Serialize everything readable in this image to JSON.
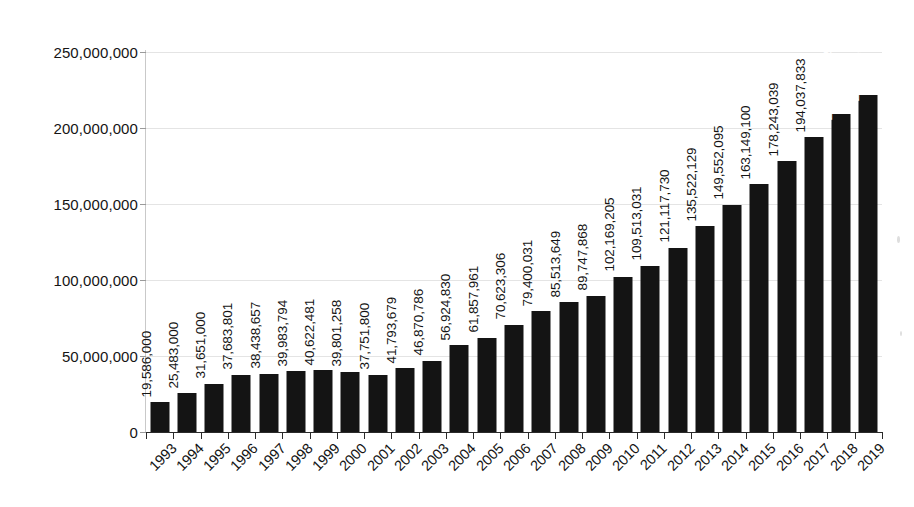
{
  "chart_data": {
    "type": "bar",
    "title": "",
    "subtitle": "",
    "xlabel": "",
    "ylabel": "",
    "grid": true,
    "legend": "none",
    "bar_color": "#141414",
    "gridline_color": "#e4e4e4",
    "axis_color": "#2a2a2a",
    "inside_label_color": "#ffffff",
    "ylim": [
      0,
      250000000
    ],
    "ytick_values": [
      0,
      50000000,
      100000000,
      150000000,
      200000000,
      250000000
    ],
    "ytick_labels": [
      "0",
      "50,000,000",
      "100,000,000",
      "150,000,000",
      "200,000,000",
      "250,000,000"
    ],
    "categories": [
      "1993",
      "1994",
      "1995",
      "1996",
      "1997",
      "1998",
      "1999",
      "2000",
      "2001",
      "2002",
      "2003",
      "2004",
      "2005",
      "2006",
      "2007",
      "2008",
      "2009",
      "2010",
      "2011",
      "2012",
      "2013",
      "2014",
      "2015",
      "2016",
      "2017",
      "2018",
      "2019"
    ],
    "values": [
      19586000,
      25483000,
      31651000,
      37683801,
      38438657,
      39983794,
      40622481,
      39801258,
      37751800,
      41793679,
      46870786,
      56924830,
      61857961,
      70623306,
      79400031,
      85513649,
      89747868,
      102169205,
      109513031,
      121117730,
      135522129,
      149552095,
      163149100,
      178243039,
      194037833,
      208904179,
      221656505
    ],
    "value_labels": [
      "19,586,000",
      "25,483,000",
      "31,651,000",
      "37,683,801",
      "38,438,657",
      "39,983,794",
      "40,622,481",
      "39,801,258",
      "37,751,800",
      "41,793,679",
      "46,870,786",
      "56,924,830",
      "61,857,961",
      "70,623,306",
      "79,400,031",
      "85,513,649",
      "89,747,868",
      "102,169,205",
      "109,513,031",
      "121,117,730",
      "135,522,129",
      "149,552,095",
      "163,149,100",
      "178,243,039",
      "194,037,833",
      "208,904,179",
      "221,656,505"
    ],
    "label_placement": [
      "outside",
      "outside",
      "outside",
      "outside",
      "outside",
      "outside",
      "outside",
      "outside",
      "outside",
      "outside",
      "outside",
      "outside",
      "outside",
      "outside",
      "outside",
      "outside",
      "outside",
      "outside",
      "outside",
      "outside",
      "outside",
      "outside",
      "outside",
      "outside",
      "outside",
      "inside",
      "inside"
    ]
  }
}
